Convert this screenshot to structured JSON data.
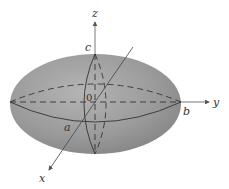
{
  "diagram": {
    "type": "ellipsoid",
    "colors": {
      "fill": "#9a9a9a",
      "fill_highlight": "#b8b8b8",
      "fill_shadow": "#7e7e7e",
      "line": "#333333",
      "axis": "#555555"
    },
    "axes": {
      "x": {
        "label": "x"
      },
      "y": {
        "label": "y"
      },
      "z": {
        "label": "z"
      }
    },
    "intercepts": {
      "a": "a",
      "b": "b",
      "c": "c"
    },
    "origin": {
      "label": "0"
    }
  }
}
